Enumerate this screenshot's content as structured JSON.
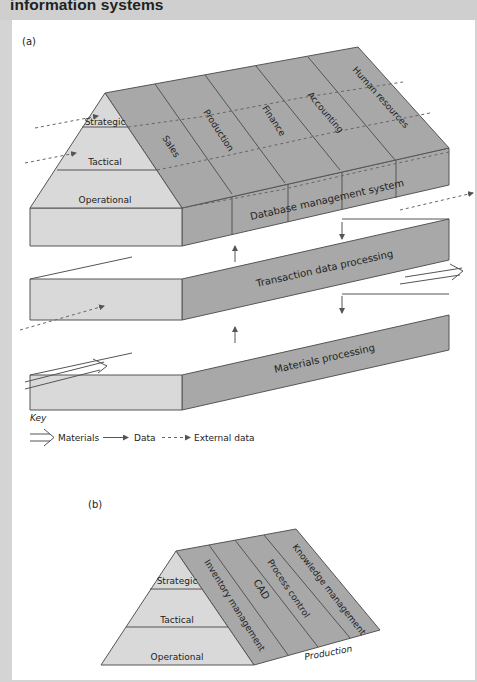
{
  "header": {
    "title": "information systems"
  },
  "colors": {
    "light_face": "#d9d9d9",
    "dark_face": "#a8a8a8",
    "outline": "#555555",
    "frame": "#d4d4d4"
  },
  "diagram_a": {
    "label": "(a)",
    "pyramid_levels": [
      "Strategic",
      "Tactical",
      "Operational"
    ],
    "functional_areas": [
      "Sales",
      "Production",
      "Finance",
      "Accounting",
      "Human resources"
    ],
    "layers": {
      "top": "Database management system",
      "middle": "Transaction data processing",
      "bottom": "Materials processing"
    }
  },
  "key": {
    "title": "Key",
    "items": [
      {
        "icon": "materials-arrow-icon",
        "label": "Materials"
      },
      {
        "icon": "data-arrow-icon",
        "label": "Data"
      },
      {
        "icon": "external-data-arrow-icon",
        "label": "External data"
      }
    ]
  },
  "diagram_b": {
    "label": "(b)",
    "pyramid_levels": [
      "Strategic",
      "Tactical",
      "Operational"
    ],
    "functional_areas": [
      "Inventory management",
      "CAD",
      "Process control",
      "Knowledge management"
    ],
    "footer_label": "Production"
  }
}
